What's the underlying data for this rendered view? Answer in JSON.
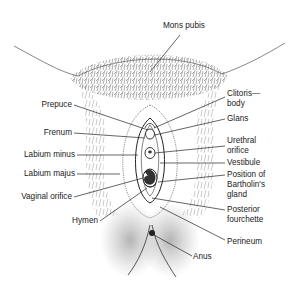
{
  "diagram": {
    "type": "anatomical-line-drawing",
    "labels_left": [
      {
        "id": "prepuce",
        "text": "Prepuce"
      },
      {
        "id": "frenum",
        "text": "Frenum"
      },
      {
        "id": "labium-minus",
        "text": "Labium minus"
      },
      {
        "id": "labium-majus",
        "text": "Labium majus"
      },
      {
        "id": "vaginal-orifice",
        "text": "Vaginal orifice"
      },
      {
        "id": "hymen",
        "text": "Hymen"
      }
    ],
    "labels_top": [
      {
        "id": "mons-pubis",
        "text": "Mons pubis"
      }
    ],
    "labels_right": [
      {
        "id": "clitoris-body",
        "lines": [
          "Clitoris—",
          "body"
        ]
      },
      {
        "id": "glans",
        "text": "Glans"
      },
      {
        "id": "urethral-orifice",
        "lines": [
          "Urethral",
          "orifice"
        ]
      },
      {
        "id": "vestibule",
        "text": "Vestibule"
      },
      {
        "id": "bartholins-gland",
        "lines": [
          "Position of",
          "Bartholin's",
          "gland"
        ]
      },
      {
        "id": "posterior-fourchette",
        "lines": [
          "Posterior",
          "fourchette"
        ]
      },
      {
        "id": "perineum",
        "text": "Perineum"
      }
    ],
    "labels_bottom": [
      {
        "id": "anus",
        "text": "Anus"
      }
    ],
    "colors": {
      "ink": "#222222",
      "background": "#ffffff",
      "stipple": "#555555"
    }
  }
}
